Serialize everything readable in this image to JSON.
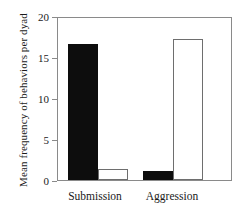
{
  "chart_data": {
    "type": "bar",
    "title": "",
    "xlabel": "",
    "ylabel": "Mean frequency of behaviors per dyad",
    "categories": [
      "Submission",
      "Aggression"
    ],
    "series": [
      {
        "name": "filled",
        "values": [
          16.6,
          1.1
        ]
      },
      {
        "name": "open",
        "values": [
          1.3,
          17.2
        ]
      }
    ],
    "ylim": [
      0,
      20
    ],
    "yticks": [
      0,
      5,
      10,
      15,
      20
    ],
    "ytick_labels": [
      "0",
      "5",
      "10",
      "15",
      "20"
    ],
    "grid": false,
    "legend": "none"
  },
  "axis": {
    "y_title": "Mean frequency of behaviors per dyad",
    "ticks": [
      {
        "value": 20,
        "label": "20"
      },
      {
        "value": 15,
        "label": "15"
      },
      {
        "value": 10,
        "label": "10"
      },
      {
        "value": 5,
        "label": "5"
      },
      {
        "value": 0,
        "label": "0"
      }
    ]
  },
  "groups": [
    {
      "label": "Submission",
      "filled": 16.6,
      "open": 1.3
    },
    {
      "label": "Aggression",
      "filled": 1.1,
      "open": 17.2
    }
  ],
  "colors": {
    "filled_bar": "#0d0d0d",
    "open_bar_fill": "#ffffff",
    "open_bar_stroke": "#6e6e6e",
    "frame": "#8a8a8a",
    "text": "#1a1a1a",
    "background": "#ffffff"
  }
}
